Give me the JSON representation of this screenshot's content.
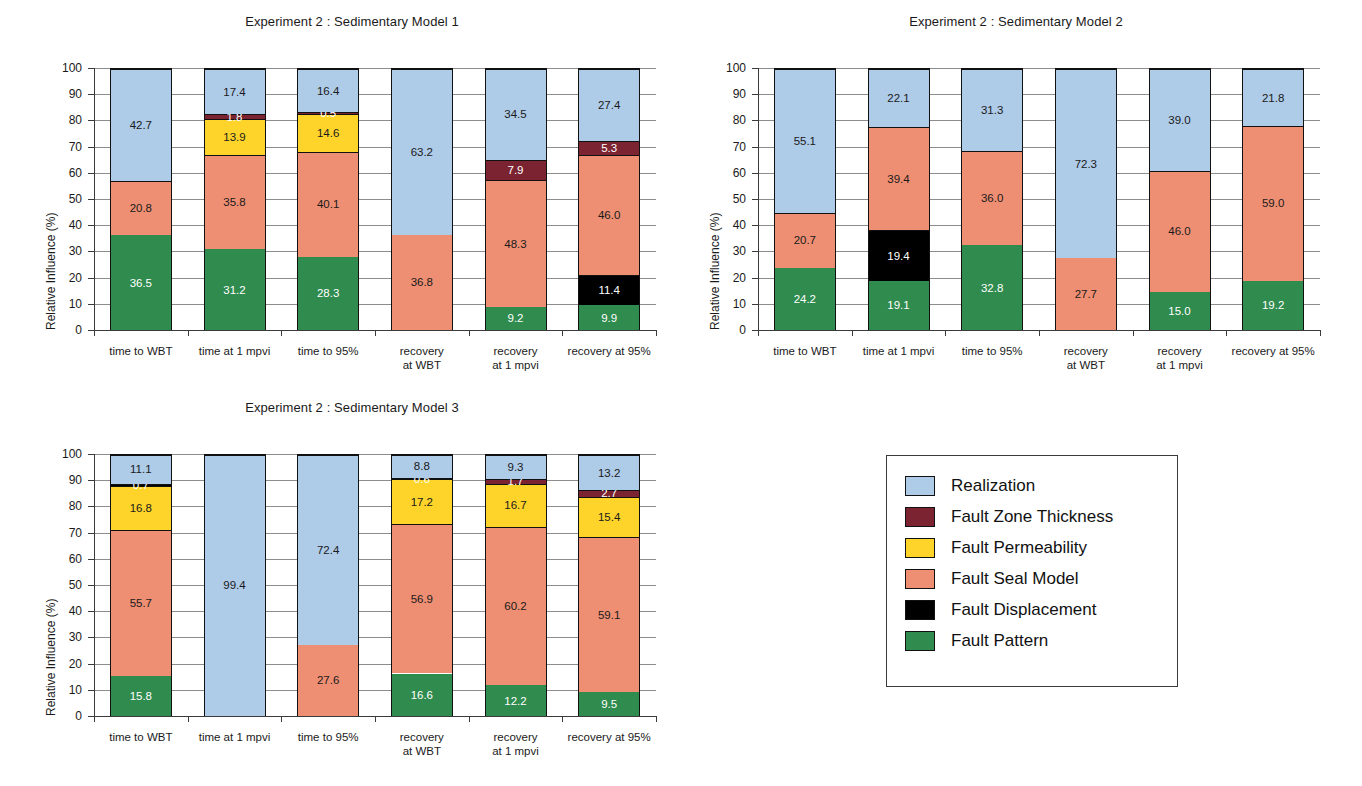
{
  "chart_data": [
    {
      "type": "bar",
      "stacked": true,
      "title": "Experiment 2 : Sedimentary Model 1",
      "xlabel": "",
      "ylabel": "Relative Influence (%)",
      "ylim": [
        0,
        100
      ],
      "ytick_labels": [
        "0",
        "10",
        "20",
        "30",
        "40",
        "50",
        "60",
        "70",
        "80",
        "90",
        "100"
      ],
      "grid": true,
      "legend_position": "external-right",
      "categories": [
        "time to WBT",
        "time at 1 mpvi",
        "time to 95%",
        "recovery\nat WBT",
        "recovery\nat 1 mpvi",
        "recovery at 95%"
      ],
      "series": [
        {
          "name": "Fault Pattern",
          "values": [
            36.5,
            31.2,
            28.3,
            0,
            9.2,
            9.9
          ]
        },
        {
          "name": "Fault Displacement",
          "values": [
            0,
            0,
            0,
            0,
            0,
            11.4
          ]
        },
        {
          "name": "Fault Seal Model",
          "values": [
            20.8,
            35.8,
            40.1,
            36.8,
            48.3,
            46.0
          ]
        },
        {
          "name": "Fault Permeability",
          "values": [
            0,
            13.9,
            14.6,
            0,
            0,
            0
          ]
        },
        {
          "name": "Fault Zone Thickness",
          "values": [
            0,
            1.8,
            0.5,
            0,
            7.9,
            5.3
          ]
        },
        {
          "name": "Realization",
          "values": [
            42.7,
            17.4,
            16.4,
            63.2,
            34.5,
            27.4
          ]
        }
      ]
    },
    {
      "type": "bar",
      "stacked": true,
      "title": "Experiment 2 : Sedimentary Model 2",
      "xlabel": "",
      "ylabel": "Relative Influence (%)",
      "ylim": [
        0,
        100
      ],
      "ytick_labels": [
        "0",
        "10",
        "20",
        "30",
        "40",
        "50",
        "60",
        "70",
        "80",
        "90",
        "100"
      ],
      "grid": true,
      "legend_position": "external-right",
      "categories": [
        "time to WBT",
        "time at 1 mpvi",
        "time to 95%",
        "recovery\nat WBT",
        "recovery\nat 1 mpvi",
        "recovery at 95%"
      ],
      "series": [
        {
          "name": "Fault Pattern",
          "values": [
            24.2,
            19.1,
            32.8,
            0,
            15.0,
            19.2
          ]
        },
        {
          "name": "Fault Displacement",
          "values": [
            0,
            19.4,
            0,
            0,
            0,
            0
          ]
        },
        {
          "name": "Fault Seal Model",
          "values": [
            20.7,
            39.4,
            36.0,
            27.7,
            46.0,
            59.0
          ]
        },
        {
          "name": "Fault Permeability",
          "values": [
            0,
            0,
            0,
            0,
            0,
            0
          ]
        },
        {
          "name": "Fault Zone Thickness",
          "values": [
            0,
            0,
            0,
            0,
            0,
            0
          ]
        },
        {
          "name": "Realization",
          "values": [
            55.1,
            22.1,
            31.3,
            72.3,
            39.0,
            21.8
          ]
        }
      ]
    },
    {
      "type": "bar",
      "stacked": true,
      "title": "Experiment 2 : Sedimentary Model 3",
      "xlabel": "",
      "ylabel": "Relative Influence (%)",
      "ylim": [
        0,
        100
      ],
      "ytick_labels": [
        "0",
        "10",
        "20",
        "30",
        "40",
        "50",
        "60",
        "70",
        "80",
        "90",
        "100"
      ],
      "grid": true,
      "legend_position": "external-right",
      "categories": [
        "time to WBT",
        "time at 1 mpvi",
        "time to 95%",
        "recovery\nat WBT",
        "recovery\nat 1 mpvi",
        "recovery at 95%"
      ],
      "series": [
        {
          "name": "Fault Pattern",
          "values": [
            15.8,
            0,
            0,
            16.6,
            12.2,
            9.5
          ]
        },
        {
          "name": "Fault Displacement",
          "values": [
            0,
            0.5,
            0,
            0,
            0,
            0
          ]
        },
        {
          "name": "Fault Seal Model",
          "values": [
            55.7,
            0,
            27.6,
            56.9,
            60.2,
            59.1
          ]
        },
        {
          "name": "Fault Permeability",
          "values": [
            16.8,
            0,
            0,
            17.2,
            16.7,
            15.4
          ]
        },
        {
          "name": "Fault Zone Thickness",
          "values": [
            0,
            0,
            0,
            0,
            1.7,
            2.7
          ]
        },
        {
          "name": "Fault Displacement Top",
          "values": [
            0.7,
            0,
            0,
            0.6,
            0,
            0
          ]
        },
        {
          "name": "Realization",
          "values": [
            11.1,
            99.4,
            72.4,
            8.8,
            9.3,
            13.2
          ]
        }
      ]
    }
  ],
  "legend": {
    "items": [
      {
        "label": "Realization",
        "color": "#aecbe8"
      },
      {
        "label": "Fault Zone Thickness",
        "color": "#7b2330"
      },
      {
        "label": "Fault Permeability",
        "color": "#ffd42a"
      },
      {
        "label": "Fault Seal Model",
        "color": "#ee8f73"
      },
      {
        "label": "Fault Displacement",
        "color": "#000000"
      },
      {
        "label": "Fault Pattern",
        "color": "#2f8b4e"
      }
    ]
  },
  "colors": {
    "realization": "#aecbe8",
    "fault_zone_thickness": "#7b2330",
    "fault_permeability": "#ffd42a",
    "fault_seal_model": "#ee8f73",
    "fault_displacement": "#000000",
    "fault_pattern": "#2f8b4e",
    "grid": "#8d8d8d",
    "axis": "#3b3b3b"
  }
}
